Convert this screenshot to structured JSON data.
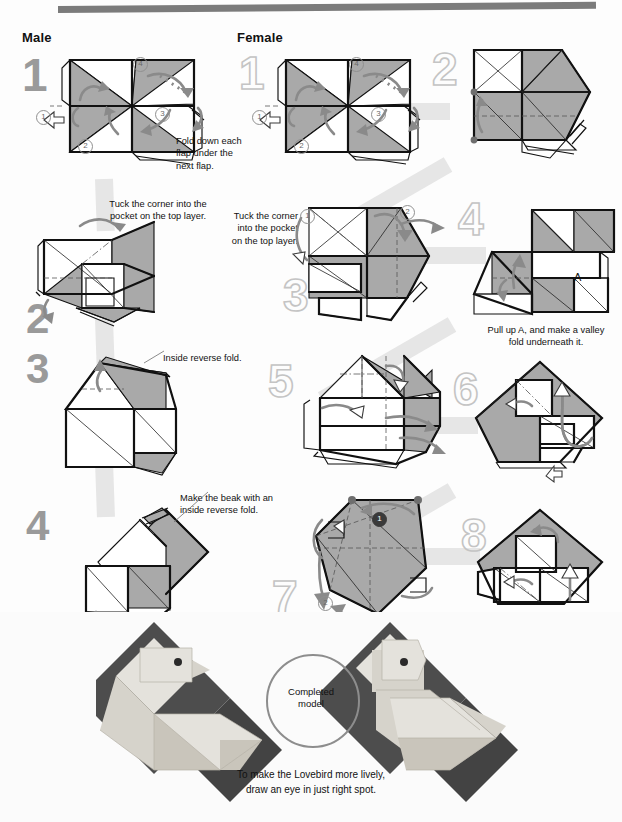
{
  "page": {
    "accent_gray": "#7b7b7b",
    "paper_gray": "#a9a9a9",
    "ribbon_gray": "#e6e6e6"
  },
  "columns": [
    {
      "id": "male",
      "label": "Male"
    },
    {
      "id": "female",
      "label": "Female"
    }
  ],
  "male_steps": [
    {
      "num": "1",
      "style": "solid"
    },
    {
      "num": "2",
      "style": "solid"
    },
    {
      "num": "3",
      "style": "solid"
    },
    {
      "num": "4",
      "style": "solid"
    }
  ],
  "female_steps": [
    {
      "num": "1",
      "style": "outline"
    },
    {
      "num": "2",
      "style": "outline"
    },
    {
      "num": "3",
      "style": "outline"
    },
    {
      "num": "4",
      "style": "outline"
    },
    {
      "num": "5",
      "style": "outline"
    },
    {
      "num": "6",
      "style": "outline"
    },
    {
      "num": "7",
      "style": "outline"
    },
    {
      "num": "8",
      "style": "outline"
    }
  ],
  "notes": {
    "male_1": "Fold down each flap under the next flap.",
    "male_2": "Tuck the corner into the pocket on the top layer.",
    "male_3": "Inside reverse fold.",
    "male_4": "Make the beak with an inside reverse fold.",
    "female_3": "Tuck the corner into the pocket on the top layer.",
    "female_4": "Pull up A, and make a valley fold underneath it."
  },
  "labels": {
    "point_a": "A"
  },
  "circled": {
    "male_1": [
      "1",
      "2",
      "3",
      "4"
    ],
    "female_1": [
      "1",
      "2",
      "3",
      "4"
    ],
    "female_3": [
      "1",
      "2"
    ],
    "female_7": [
      "1",
      "2"
    ]
  },
  "photo": {
    "circle_label_line1": "Completed",
    "circle_label_line2": "model",
    "caption_line1": "To make the Lovebird more lively,",
    "caption_line2": "draw an eye in just right spot."
  }
}
